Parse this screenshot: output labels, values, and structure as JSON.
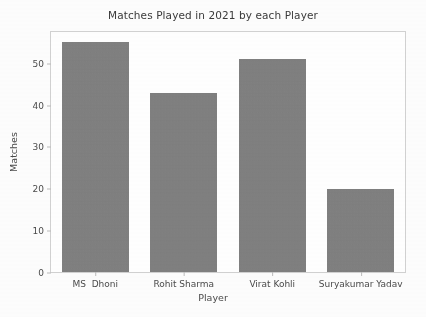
{
  "chart_data": {
    "type": "bar",
    "title": "Matches Played in 2021 by each Player",
    "xlabel": "Player",
    "ylabel": "Matches",
    "categories": [
      "MS  Dhoni",
      "Rohit Sharma",
      "Virat Kohli",
      "Suryakumar Yadav"
    ],
    "values": [
      55,
      43,
      51,
      20
    ],
    "series": [
      {
        "name": "Matches",
        "values": [
          55,
          43,
          51,
          20
        ]
      }
    ],
    "ylim": [
      0,
      57.5
    ],
    "yticks": [
      0,
      10,
      20,
      30,
      40,
      50
    ],
    "ytick_labels": [
      "0",
      "10",
      "20",
      "30",
      "40",
      "50"
    ],
    "xtick_labels": [
      "MS  Dhoni",
      "Rohit Sharma",
      "Virat Kohli",
      "Suryakumar Yadav"
    ],
    "grid": false,
    "legend": false,
    "bar_color": "#808080",
    "background_color": "#ffffff",
    "axis_color": "#d2d2d2",
    "text_color": "#4a4a4a"
  }
}
